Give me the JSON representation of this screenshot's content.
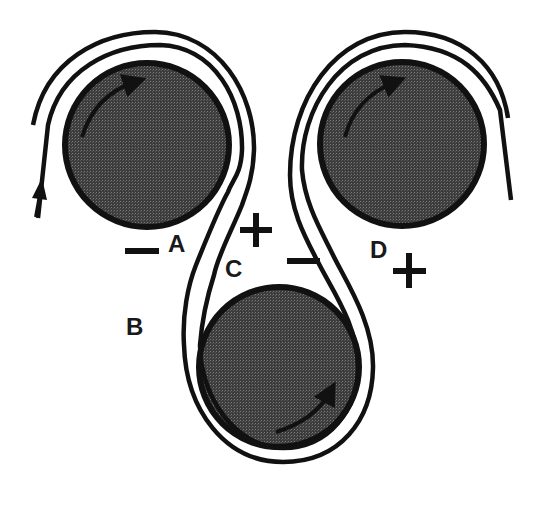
{
  "diagram": {
    "type": "three-roller web path schematic",
    "colors": {
      "roller_fill": "#4a4a4a",
      "roller_outline": "#111111",
      "line": "#111111",
      "background": "#ffffff"
    },
    "rollers": [
      {
        "id": "top-left",
        "rotation": "clockwise"
      },
      {
        "id": "top-right",
        "rotation": "clockwise"
      },
      {
        "id": "bottom",
        "rotation": "counter-clockwise"
      }
    ],
    "labels": {
      "A": "A",
      "B": "B",
      "C": "C",
      "D": "D"
    },
    "signs": {
      "near_A": "−",
      "near_C": "+",
      "center": "−",
      "near_D": "+"
    },
    "feed_arrow": "up"
  }
}
